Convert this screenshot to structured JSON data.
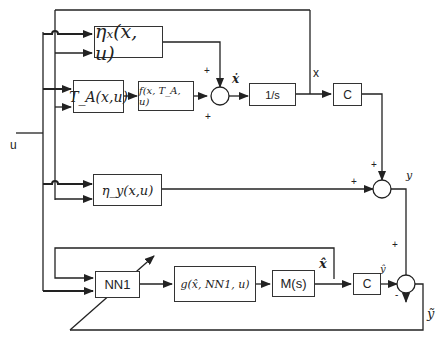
{
  "diagram": {
    "input_label": "u",
    "blocks": {
      "eta_x": "ηₓ(x, u)",
      "T_A": "T_A(x,u)",
      "f": "f(x, T_A, u)",
      "integrator": "1/s",
      "C_top": "C",
      "eta_y": "η_y(x,u)",
      "NN1": "NN1",
      "g": "g(x̂, NN1, u)",
      "M": "M(s)",
      "C_bottom": "C"
    },
    "signals": {
      "x_dot": "ẋ",
      "x": "x",
      "y": "y",
      "x_hat": "x̂",
      "y_hat": "ŷ",
      "y_tilde": "ỹ"
    },
    "signs": {
      "sum1_top": "+",
      "sum1_bottom": "+",
      "sum2_top": "+",
      "sum2_left": "+",
      "sum3_top": "+",
      "sum3_left": "-"
    }
  }
}
